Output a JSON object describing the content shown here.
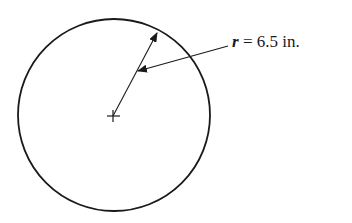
{
  "diagram": {
    "type": "circle-radius",
    "label": {
      "variable": "r",
      "equals": " = ",
      "value": "6.5",
      "unit": " in."
    },
    "colors": {
      "stroke": "#1a1a1a",
      "background": "#ffffff"
    }
  }
}
